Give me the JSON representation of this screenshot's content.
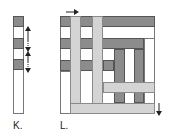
{
  "figure_k": {
    "label": "K.",
    "segments": [
      "dark",
      "white",
      "dark",
      "white",
      "dark",
      "white",
      "white",
      "white",
      "white"
    ],
    "arrows": [
      "up",
      "down",
      "up",
      "down"
    ]
  },
  "figure_l": {
    "label": "L.",
    "arrows": [
      "right",
      "down"
    ]
  },
  "colors": {
    "dark": "#8c8c8c",
    "light": "#d4d4d4",
    "white": "#ffffff",
    "outline": "#555555"
  }
}
